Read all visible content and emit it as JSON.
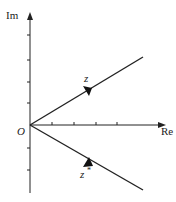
{
  "diagram": {
    "axes": {
      "imaginary_label": "Im",
      "real_label": "Re",
      "origin_label": "O",
      "real_ticks": 4,
      "imag_ticks_positive": 4,
      "imag_ticks_negative": 2
    },
    "vectors": [
      {
        "label": "z",
        "superscript": "",
        "direction": "upper-right"
      },
      {
        "label": "z",
        "superscript": "*",
        "direction": "lower-right"
      }
    ],
    "colors": {
      "line": "#222222",
      "background": "#ffffff"
    }
  }
}
